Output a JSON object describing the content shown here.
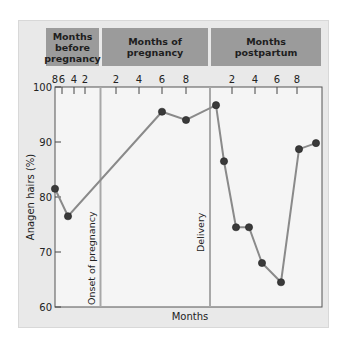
{
  "chart_data": {
    "type": "line",
    "title": "",
    "xlabel": "Months",
    "ylabel": "Anagen hairs (%)",
    "ylim": [
      60,
      100
    ],
    "yticks": [
      60,
      70,
      80,
      90,
      100
    ],
    "grid": false,
    "legend": null,
    "sections": [
      {
        "label": "Months\nbefore\npregnancy",
        "ticks": [
          "8",
          "6",
          "4",
          "2"
        ]
      },
      {
        "label": "Months of\npregnancy",
        "ticks": [
          "2",
          "4",
          "6",
          "8"
        ]
      },
      {
        "label": "Months\npostpartum",
        "ticks": [
          "2",
          "4",
          "6",
          "8"
        ]
      }
    ],
    "annotations": [
      "Onset of pregnancy",
      "Delivery"
    ],
    "series": [
      {
        "name": "Anagen hairs",
        "points": [
          {
            "period": "before pregnancy",
            "month": 8,
            "value": 81.5
          },
          {
            "period": "before pregnancy",
            "month": 6,
            "value": 76.5
          },
          {
            "period": "pregnancy",
            "month": 6,
            "value": 95.5
          },
          {
            "period": "pregnancy",
            "month": 8,
            "value": 94
          },
          {
            "period": "pregnancy",
            "month": 9.5,
            "value": 96.7
          },
          {
            "period": "postpartum",
            "month": 1.2,
            "value": 86.5
          },
          {
            "period": "postpartum",
            "month": 2.3,
            "value": 74.5
          },
          {
            "period": "postpartum",
            "month": 3.5,
            "value": 74.5
          },
          {
            "period": "postpartum",
            "month": 4.6,
            "value": 68
          },
          {
            "period": "postpartum",
            "month": 6.4,
            "value": 64.5
          },
          {
            "period": "postpartum",
            "month": 8.2,
            "value": 88.7
          },
          {
            "period": "postpartum",
            "month": 9.8,
            "value": 89.8
          }
        ]
      }
    ]
  },
  "colors": {
    "panel": "#e9e9e9",
    "plot": "#f5f5f5",
    "header": "#9b9b9b",
    "line": "#8a8a8a",
    "marker": "#3a3a3a",
    "divider": "#a8a8a8"
  }
}
